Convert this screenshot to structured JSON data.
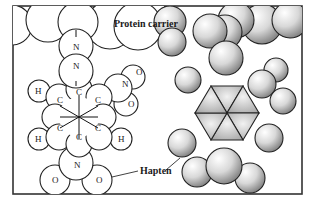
{
  "figure": {
    "labels": {
      "protein_carrier": "Protein carrier",
      "hapten": "Hapten"
    },
    "atoms": {
      "N1": "N",
      "N2": "N",
      "N3": "N",
      "N4": "N",
      "O1": "O",
      "O2": "O",
      "O3": "O",
      "O4": "O",
      "C1": "C",
      "C2": "C",
      "C3": "C",
      "C4": "C",
      "C5": "C",
      "C6": "C",
      "H1": "H",
      "H2": "H",
      "H3": "H"
    }
  }
}
